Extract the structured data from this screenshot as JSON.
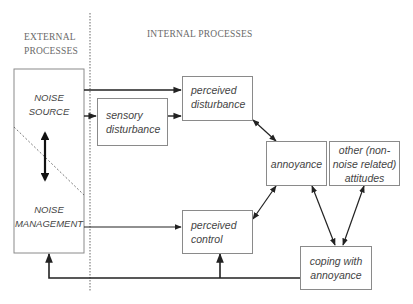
{
  "headers": {
    "external": [
      "EXTERNAL",
      "PROCESSES"
    ],
    "internal": "INTERNAL PROCESSES"
  },
  "nodes": {
    "noise_source": [
      "NOISE",
      "SOURCE"
    ],
    "noise_management": [
      "NOISE",
      "MANAGEMENT"
    ],
    "sensory_disturbance": [
      "sensory",
      "disturbance"
    ],
    "perceived_disturbance": [
      "perceived",
      "disturbance"
    ],
    "annoyance": "annoyance",
    "other_attitudes": [
      "other (non-",
      "noise related)",
      "attitudes"
    ],
    "perceived_control": [
      "perceived",
      "control"
    ],
    "coping": [
      "coping with",
      "annoyance"
    ]
  },
  "edges": [
    {
      "from": "noise_source",
      "to": "perceived_disturbance",
      "type": "arrow"
    },
    {
      "from": "noise_source",
      "to": "sensory_disturbance",
      "type": "arrow"
    },
    {
      "from": "sensory_disturbance",
      "to": "perceived_disturbance",
      "type": "arrow"
    },
    {
      "from": "noise_source",
      "to": "noise_management",
      "type": "bidirectional"
    },
    {
      "from": "perceived_disturbance",
      "to": "annoyance",
      "type": "bidirectional"
    },
    {
      "from": "perceived_control",
      "to": "annoyance",
      "type": "bidirectional"
    },
    {
      "from": "annoyance",
      "to": "coping",
      "type": "bidirectional"
    },
    {
      "from": "other_attitudes",
      "to": "coping",
      "type": "bidirectional"
    },
    {
      "from": "noise_management",
      "to": "perceived_control",
      "type": "arrow"
    },
    {
      "from": "coping",
      "to": "perceived_control",
      "type": "arrow"
    },
    {
      "from": "coping",
      "to": "noise_management",
      "type": "arrow"
    }
  ],
  "colors": {
    "line": "#222222",
    "box_border": "#8a8a8a",
    "divider": "#a0a0a0",
    "text": "#444444"
  }
}
